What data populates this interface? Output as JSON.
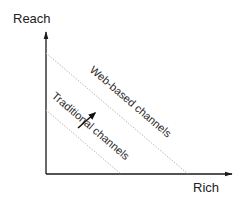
{
  "diagram": {
    "y_axis": {
      "label": "Reach"
    },
    "x_axis": {
      "label": "Rich"
    },
    "bands": [
      {
        "label": "Web-based channels",
        "style": "dotted-gray"
      },
      {
        "label": "Traditional channels",
        "style": "dotted-gray"
      }
    ],
    "shift_arrow": {
      "direction": "up-right",
      "meaning": "shift from traditional to web-based channels"
    },
    "colors": {
      "axis": "#1a1a1a",
      "frontier_line": "#b8b8b8",
      "text": "#222222"
    }
  }
}
